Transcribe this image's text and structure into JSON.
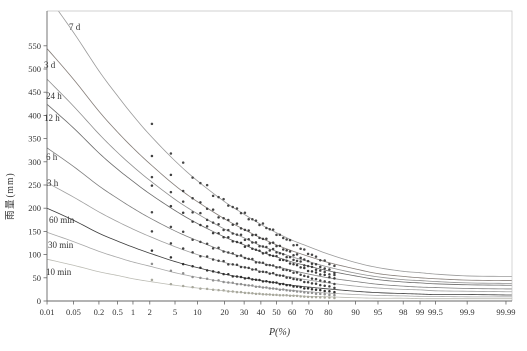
{
  "figure": {
    "background": "#ffffff",
    "axis_color": "#666666",
    "frame_light_color": "#c4c4c4",
    "tick_label_color": "#333333",
    "series_label_color": "#333333"
  },
  "chart_data": {
    "type": "line",
    "title": "",
    "xlabel": "P(%)",
    "ylabel": "雨量(mm)",
    "x_scale": "normal-probability",
    "grid": false,
    "legend": "labels-on-curves",
    "ylim": [
      0,
      625
    ],
    "y_ticks": [
      0,
      50,
      100,
      150,
      200,
      250,
      300,
      350,
      400,
      450,
      500,
      550
    ],
    "x_tick_values": [
      0.01,
      0.05,
      0.2,
      0.5,
      1,
      2,
      5,
      10,
      20,
      30,
      40,
      50,
      60,
      70,
      80,
      90,
      95,
      98,
      99,
      99.5,
      99.9,
      99.99
    ],
    "x_tick_labels": [
      "0.01",
      "0.05",
      "0.2",
      "0.5",
      "1",
      "2",
      "5",
      "10",
      "20",
      "30",
      "40",
      "50",
      "60",
      "70",
      "80",
      "90",
      "95",
      "98",
      "99",
      "99.5",
      "99.9",
      "99.99"
    ],
    "probabilities": [
      0.01,
      0.05,
      0.2,
      0.5,
      1,
      2,
      5,
      10,
      20,
      30,
      40,
      50,
      60,
      70,
      80,
      90,
      95,
      98,
      99,
      99.5,
      99.9,
      99.99
    ],
    "series": [
      {
        "name": "7 d",
        "color": "#9a9a9a",
        "marker_color": "#474747",
        "label_pos": [
          69,
          30
        ],
        "values": [
          659,
          579,
          496,
          442,
          400,
          358,
          302,
          259,
          214,
          187,
          165,
          147,
          131,
          117,
          101,
          83,
          72,
          64,
          61,
          58,
          54,
          53
        ]
      },
      {
        "name": "3 d",
        "color": "#857d78",
        "marker_color": "#3f3f3f",
        "label_pos": [
          44,
          68
        ],
        "values": [
          544,
          478,
          409,
          364,
          330,
          296,
          249,
          214,
          177,
          154,
          136,
          121,
          108,
          96,
          83,
          69,
          59,
          53,
          50,
          48,
          45,
          44
        ]
      },
      {
        "name": "24 h",
        "color": "#8f8f8f",
        "marker_color": "#424242",
        "label_pos": [
          46,
          99
        ],
        "values": [
          478,
          420,
          360,
          320,
          290,
          260,
          219,
          188,
          155,
          136,
          119,
          107,
          95,
          85,
          73,
          60,
          52,
          46,
          44,
          42,
          39,
          38
        ]
      },
      {
        "name": "12 h",
        "color": "#6b6b6b",
        "marker_color": "#3a3a3a",
        "label_pos": [
          44,
          121
        ],
        "values": [
          424,
          373,
          319,
          284,
          258,
          231,
          195,
          167,
          138,
          121,
          106,
          95,
          84,
          75,
          65,
          54,
          46,
          41,
          39,
          37,
          35,
          34
        ]
      },
      {
        "name": "6 h",
        "color": "#7e7e7e",
        "marker_color": "#454545",
        "label_pos": [
          46,
          160
        ],
        "values": [
          330,
          290,
          248,
          221,
          200,
          179,
          151,
          130,
          107,
          94,
          82,
          74,
          66,
          58,
          50,
          42,
          36,
          32,
          30,
          29,
          27,
          26
        ]
      },
      {
        "name": "3 h",
        "color": "#a0a0a0",
        "marker_color": "#404040",
        "label_pos": [
          47,
          186
        ],
        "values": [
          255,
          224,
          192,
          171,
          155,
          139,
          117,
          100,
          83,
          73,
          64,
          57,
          51,
          45,
          39,
          32,
          28,
          25,
          24,
          22,
          21,
          20
        ]
      },
      {
        "name": "60 min",
        "color": "#3c3c3c",
        "marker_color": "#2f2f2f",
        "label_pos": [
          49,
          223
        ],
        "values": [
          200,
          174,
          146,
          129,
          116,
          103,
          85,
          72,
          58,
          50,
          44,
          39,
          34,
          30,
          26,
          21,
          18,
          16,
          15,
          14,
          14,
          13
        ]
      },
      {
        "name": "30 min",
        "color": "#a8a8a8",
        "marker_color": "#8f8f8f",
        "label_pos": [
          48,
          248
        ],
        "values": [
          148,
          128,
          107,
          94,
          84,
          75,
          61,
          51,
          41,
          35,
          30,
          26,
          23,
          20,
          17,
          14,
          12,
          11,
          10,
          10,
          9,
          9
        ]
      },
      {
        "name": "10 min",
        "color": "#bcbcb4",
        "marker_color": "#a8a89c",
        "label_pos": [
          46,
          275
        ],
        "values": [
          90,
          77,
          63,
          55,
          48,
          42,
          34,
          28,
          22,
          18,
          15,
          13,
          12,
          10,
          9,
          7,
          6,
          6,
          5,
          5,
          5,
          5
        ]
      }
    ],
    "scatter": {
      "n_points": 38,
      "rank_denominator": 46,
      "noise_stride": 7,
      "base_trend": [
        1.07,
        1.04,
        1.02,
        1.0,
        1.0,
        1.0,
        1.0,
        1.0,
        1.0,
        1.0,
        1.0,
        1.0,
        1.0,
        1.0,
        1.0,
        1.0,
        1.0,
        1.0,
        1.0,
        1.0,
        1.0,
        1.0,
        0.99,
        0.985,
        0.98,
        0.97,
        0.96,
        0.95,
        0.94,
        0.92,
        0.9,
        0.88,
        0.87,
        0.85,
        0.84,
        0.82,
        0.8,
        0.78
      ],
      "noise": [
        1.01,
        0.982,
        1.021,
        0.991,
        1.0,
        1.028,
        0.972,
        1.0,
        1.018,
        0.984,
        1.0,
        1.012,
        0.99,
        1.022,
        0.973,
        1.0,
        1.011,
        0.981,
        1.027,
        0.992,
        1.0,
        1.019,
        0.979,
        1.009,
        0.989,
        1.0,
        1.026,
        0.974,
        1.012,
        0.988,
        1.02,
        0.981,
        1.0,
        1.013,
        0.971,
        1.023,
        0.99,
        1.0
      ]
    }
  }
}
